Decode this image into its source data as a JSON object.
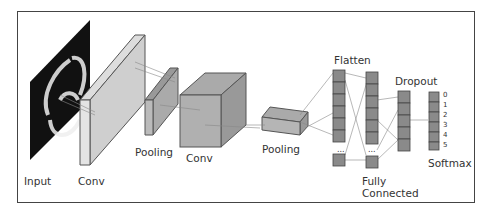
{
  "diagram": {
    "labels": {
      "input": "Input",
      "conv1": "Conv",
      "pool1": "Pooling",
      "conv2": "Conv",
      "pool2": "Pooling",
      "flatten": "Flatten",
      "fc_line1": "Fully",
      "fc_line2": "Connected",
      "dropout": "Dropout",
      "softmax": "Softmax"
    },
    "softmax_outputs": [
      "0",
      "1",
      "2",
      "3",
      "4",
      "5"
    ],
    "ellipsis": "...",
    "colors": {
      "block_fill": "#c8c8c8",
      "unit_fill": "#8a8a8a",
      "stroke": "#444444"
    }
  }
}
